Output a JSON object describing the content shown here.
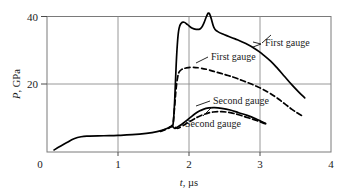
{
  "chart_data": {
    "type": "line",
    "title": "",
    "xlabel": "t, µs",
    "xlabel_symbol": "t",
    "xlabel_unit": ", µs",
    "ylabel": "P, GPa",
    "ylabel_symbol": "P",
    "ylabel_unit": ", GPa",
    "xlim": [
      0,
      4
    ],
    "ylim": [
      0,
      40
    ],
    "xticks": [
      0,
      1,
      2,
      3,
      4
    ],
    "xtick_labels": [
      "0",
      "1",
      "2",
      "3",
      "4"
    ],
    "yticks": [
      0,
      20,
      40
    ],
    "ytick_labels": [
      "0",
      "20",
      "40"
    ],
    "grid": "major-gridlines-at-x=1,2,3 and y=20",
    "legend_position": "inline-annotations",
    "line_color": "#000000",
    "frame_color": "#7a7a7a",
    "series": [
      {
        "name": "First gauge",
        "style": "solid",
        "label_text": "First gauge",
        "points": [
          [
            0.1,
            0.6
          ],
          [
            0.18,
            1.6
          ],
          [
            0.28,
            2.8
          ],
          [
            0.38,
            3.9
          ],
          [
            0.48,
            4.5
          ],
          [
            0.6,
            4.7
          ],
          [
            0.8,
            4.8
          ],
          [
            1.0,
            4.9
          ],
          [
            1.2,
            5.1
          ],
          [
            1.4,
            5.5
          ],
          [
            1.55,
            6.0
          ],
          [
            1.65,
            6.6
          ],
          [
            1.72,
            7.2
          ],
          [
            1.76,
            7.8
          ],
          [
            1.78,
            9.0
          ],
          [
            1.8,
            16.0
          ],
          [
            1.82,
            26.0
          ],
          [
            1.84,
            33.0
          ],
          [
            1.86,
            36.5
          ],
          [
            1.89,
            38.0
          ],
          [
            1.93,
            38.3
          ],
          [
            1.98,
            37.6
          ],
          [
            2.04,
            36.6
          ],
          [
            2.1,
            36.2
          ],
          [
            2.16,
            36.4
          ],
          [
            2.2,
            37.6
          ],
          [
            2.25,
            40.2
          ],
          [
            2.28,
            41.0
          ],
          [
            2.31,
            39.6
          ],
          [
            2.35,
            36.8
          ],
          [
            2.4,
            35.6
          ],
          [
            2.5,
            34.6
          ],
          [
            2.65,
            33.4
          ],
          [
            2.8,
            32.0
          ],
          [
            2.95,
            30.2
          ],
          [
            3.05,
            28.6
          ],
          [
            3.15,
            26.8
          ],
          [
            3.25,
            24.6
          ],
          [
            3.35,
            22.2
          ],
          [
            3.45,
            19.8
          ],
          [
            3.55,
            17.6
          ],
          [
            3.63,
            16.0
          ]
        ]
      },
      {
        "name": "First gauge (dashed)",
        "style": "dashed",
        "label_text": "First gauge",
        "points": [
          [
            1.78,
            9.0
          ],
          [
            1.8,
            14.0
          ],
          [
            1.82,
            19.0
          ],
          [
            1.84,
            22.0
          ],
          [
            1.86,
            23.6
          ],
          [
            1.9,
            24.4
          ],
          [
            1.96,
            24.8
          ],
          [
            2.05,
            25.0
          ],
          [
            2.15,
            24.8
          ],
          [
            2.25,
            24.4
          ],
          [
            2.35,
            23.8
          ],
          [
            2.45,
            23.2
          ],
          [
            2.55,
            22.6
          ],
          [
            2.65,
            21.9
          ],
          [
            2.75,
            21.1
          ],
          [
            2.85,
            20.3
          ],
          [
            2.95,
            19.4
          ],
          [
            3.05,
            18.4
          ],
          [
            3.15,
            17.2
          ],
          [
            3.25,
            15.8
          ],
          [
            3.35,
            14.2
          ],
          [
            3.45,
            12.6
          ],
          [
            3.55,
            11.2
          ],
          [
            3.62,
            10.4
          ]
        ]
      },
      {
        "name": "Second gauge",
        "style": "solid",
        "label_text": "Second gauge",
        "points": [
          [
            1.72,
            7.2
          ],
          [
            1.76,
            7.6
          ],
          [
            1.8,
            7.0
          ],
          [
            1.84,
            7.4
          ],
          [
            1.9,
            8.2
          ],
          [
            1.96,
            9.2
          ],
          [
            2.02,
            10.2
          ],
          [
            2.08,
            11.2
          ],
          [
            2.14,
            12.0
          ],
          [
            2.2,
            12.6
          ],
          [
            2.28,
            13.0
          ],
          [
            2.36,
            13.1
          ],
          [
            2.46,
            12.9
          ],
          [
            2.58,
            12.4
          ],
          [
            2.7,
            11.6
          ],
          [
            2.82,
            10.8
          ],
          [
            2.94,
            9.8
          ],
          [
            3.02,
            9.0
          ],
          [
            3.08,
            8.4
          ]
        ]
      },
      {
        "name": "Second gauge (dashed)",
        "style": "dashed",
        "label_text": "Second gauge",
        "points": [
          [
            1.6,
            6.1
          ],
          [
            1.7,
            6.9
          ],
          [
            1.78,
            7.6
          ],
          [
            1.84,
            7.0
          ],
          [
            1.9,
            7.6
          ],
          [
            1.98,
            8.6
          ],
          [
            2.06,
            9.6
          ],
          [
            2.14,
            10.5
          ],
          [
            2.24,
            11.3
          ],
          [
            2.34,
            11.8
          ],
          [
            2.46,
            11.9
          ],
          [
            2.58,
            11.6
          ],
          [
            2.7,
            11.0
          ],
          [
            2.82,
            10.2
          ],
          [
            2.94,
            9.4
          ],
          [
            3.04,
            8.6
          ],
          [
            3.1,
            8.2
          ]
        ]
      }
    ],
    "annotations": [
      {
        "id": "label-first-gauge-solid",
        "text": "First gauge",
        "x": 3.4,
        "y": 31.5
      },
      {
        "id": "label-first-gauge-dashed",
        "text": "First gauge",
        "x": 2.56,
        "y": 27.5
      },
      {
        "id": "label-second-gauge-solid",
        "text": "Second gauge",
        "x": 2.68,
        "y": 15.0
      },
      {
        "id": "label-second-gauge-dashed",
        "text": "Second gauge",
        "x": 2.28,
        "y": 5.4
      }
    ]
  }
}
